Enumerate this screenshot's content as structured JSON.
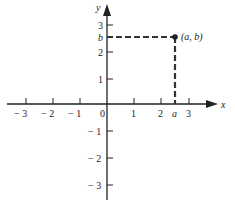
{
  "diagram": {
    "axes": {
      "x_label": "x",
      "y_label": "y"
    },
    "x_ticks": [
      {
        "label": "− 3",
        "px": 26
      },
      {
        "label": "− 2",
        "px": 53
      },
      {
        "label": "− 1",
        "px": 80
      },
      {
        "label": "0",
        "px": 102
      },
      {
        "label": "1",
        "px": 134
      },
      {
        "label": "2",
        "px": 161
      },
      {
        "label": "a",
        "px": 175
      },
      {
        "label": "3",
        "px": 189
      }
    ],
    "y_ticks": [
      {
        "label": "3",
        "py": 25
      },
      {
        "label": "b",
        "py": 37
      },
      {
        "label": "2",
        "py": 52
      },
      {
        "label": "1",
        "py": 79
      },
      {
        "label": "− 1",
        "py": 131
      },
      {
        "label": "− 2",
        "py": 158
      },
      {
        "label": "− 3",
        "py": 185
      }
    ],
    "point": {
      "label": "(a, b)",
      "x": "a",
      "y": "b"
    },
    "colors": {
      "axis": "#222222",
      "dash": "#333333"
    }
  }
}
